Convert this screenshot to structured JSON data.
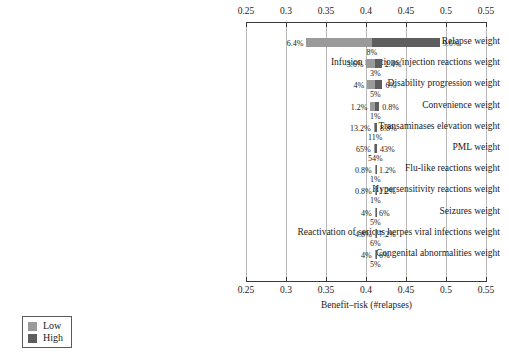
{
  "chart_data": {
    "type": "bar",
    "chart_style": "tornado",
    "title": "",
    "xlabel": "Benefit–risk (#relapses)",
    "ylabel": "",
    "xlim": [
      0.25,
      0.55
    ],
    "xticks": [
      "0.25",
      "0.3",
      "0.35",
      "0.4",
      "0.45",
      "0.5",
      "0.55"
    ],
    "xtick_values": [
      0.25,
      0.3,
      0.35,
      0.4,
      0.45,
      0.5,
      0.55
    ],
    "grid": true,
    "axis_top": true,
    "axis_bottom": true,
    "legend": {
      "position": "bottom-left",
      "entries": [
        {
          "label": "Low",
          "color": "#9a9a9a"
        },
        {
          "label": "High",
          "color": "#5e5e5e"
        }
      ]
    },
    "colors": {
      "low": "#9a9a9a",
      "high": "#5e5e5e"
    },
    "rows": [
      {
        "label": "Relapse weight",
        "low_label": "6.4%",
        "high_label": "9.6%",
        "base_label": "8%",
        "low_x": 0.3256,
        "base_x": 0.4072,
        "high_x": 0.4922
      },
      {
        "label": "Infusion reactions/injection reactions weight",
        "low_label": "3.6%",
        "high_label": "2.4%",
        "base_label": "3%",
        "low_x": 0.4006,
        "base_x": 0.4116,
        "high_x": 0.4196
      },
      {
        "label": "Disability progression weight",
        "low_label": "4%",
        "high_label": "6%",
        "base_label": "5%",
        "low_x": 0.4016,
        "base_x": 0.4116,
        "high_x": 0.4206
      },
      {
        "label": "Convenience weight",
        "low_label": "1.2%",
        "high_label": "0.8%",
        "base_label": "1%",
        "low_x": 0.4056,
        "base_x": 0.4116,
        "high_x": 0.4166
      },
      {
        "label": "Transaminases elevation weight",
        "low_label": "13.2%",
        "high_label": "8.8%",
        "base_label": "11%",
        "low_x": 0.4096,
        "base_x": 0.4116,
        "high_x": 0.4136
      },
      {
        "label": "PML weight",
        "low_label": "65%",
        "high_label": "43%",
        "base_label": "54%",
        "low_x": 0.4096,
        "base_x": 0.4116,
        "high_x": 0.4136
      },
      {
        "label": "Flu-like reactions weight",
        "low_label": "0.8%",
        "high_label": "1.2%",
        "base_label": "1%",
        "low_x": 0.4108,
        "base_x": 0.4116,
        "high_x": 0.4124
      },
      {
        "label": "Hypersensitivity reactions weight",
        "low_label": "0.8%",
        "high_label": "1.2%",
        "base_label": "1%",
        "low_x": 0.4108,
        "base_x": 0.4116,
        "high_x": 0.4124
      },
      {
        "label": "Seizures weight",
        "low_label": "4%",
        "high_label": "6%",
        "base_label": "5%",
        "low_x": 0.4108,
        "base_x": 0.4116,
        "high_x": 0.4124
      },
      {
        "label": "Reactivation of serious herpes viral infections weight",
        "low_label": "4.8%",
        "high_label": "7.2%",
        "base_label": "6%",
        "low_x": 0.4108,
        "base_x": 0.4116,
        "high_x": 0.4124
      },
      {
        "label": "Congenital abnormalities weight",
        "low_label": "4%",
        "high_label": "6%",
        "base_label": "5%",
        "low_x": 0.4108,
        "base_x": 0.4116,
        "high_x": 0.4124
      }
    ]
  }
}
